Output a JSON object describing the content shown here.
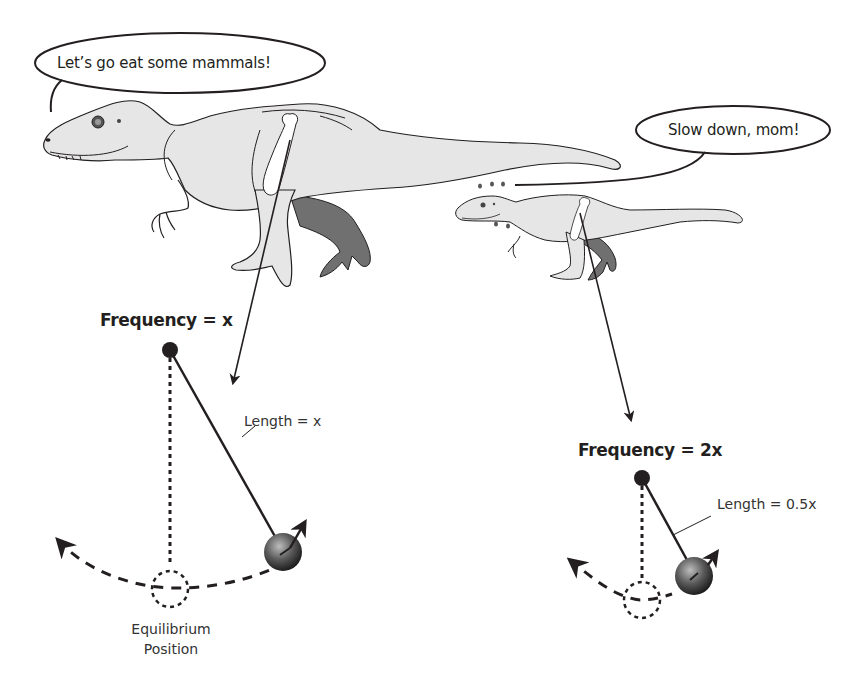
{
  "speech": {
    "mother": "Let’s go eat some mammals!",
    "baby": "Slow down, mom!"
  },
  "large_pendulum": {
    "frequency_label": "Frequency = x",
    "length_label": "Length = x",
    "equilibrium_label_line1": "Equilibrium",
    "equilibrium_label_line2": "Position"
  },
  "small_pendulum": {
    "frequency_label": "Frequency = 2x",
    "length_label": "Length = 0.5x"
  },
  "colors": {
    "dino_fill": "#e6e6e6",
    "far_leg_fill": "#707070",
    "outline": "#231f20",
    "bone_fill": "#ffffff"
  }
}
